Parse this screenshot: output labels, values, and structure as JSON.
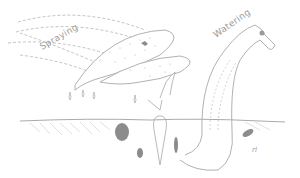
{
  "illustration": {
    "labels": {
      "spraying": "Spraying",
      "watering": "Watering",
      "signature": "rl"
    },
    "colors": {
      "line": "#a8a8a8",
      "dashed": "#b4b4b4",
      "shade": "#8c8c8c",
      "background": "#ffffff"
    }
  }
}
